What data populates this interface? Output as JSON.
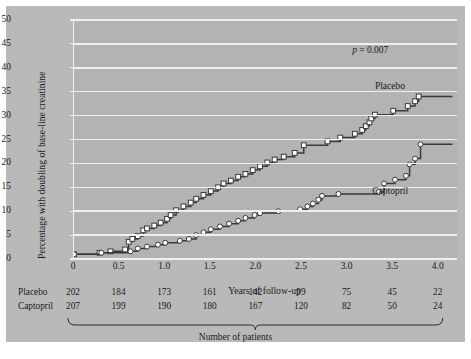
{
  "chart_data": {
    "type": "line",
    "subtype": "kaplan-meier-step",
    "title": "",
    "xlabel": "Years of follow-up",
    "ylabel": "Percentage with doubling of base-line creatinine",
    "xlim": [
      0,
      4.2
    ],
    "ylim": [
      0,
      50
    ],
    "xticks": [
      "0",
      "0.5",
      "1.0",
      "1.5",
      "2.0",
      "2.5",
      "3.0",
      "3.5",
      "4.0"
    ],
    "xtick_values": [
      0,
      0.5,
      1.0,
      1.5,
      2.0,
      2.5,
      3.0,
      3.5,
      4.0
    ],
    "yticks": [
      "0",
      "5",
      "10",
      "15",
      "20",
      "25",
      "30",
      "35",
      "40",
      "45",
      "50"
    ],
    "ytick_values": [
      0,
      5,
      10,
      15,
      20,
      25,
      30,
      35,
      40,
      45,
      50
    ],
    "grid": "horizontal",
    "legend_position": "inline-annotation",
    "annotations": [
      {
        "name": "p-value",
        "text": "p = 0.007",
        "x": 3.05,
        "y": 43.5
      }
    ],
    "series": [
      {
        "name": "Placebo",
        "marker": "open-square",
        "color": "#3a3a3a",
        "label_x": 3.3,
        "label_y": 36.0,
        "points": [
          [
            0.0,
            1.0
          ],
          [
            0.28,
            1.3
          ],
          [
            0.4,
            1.6
          ],
          [
            0.56,
            2.0
          ],
          [
            0.6,
            3.6
          ],
          [
            0.64,
            4.2
          ],
          [
            0.7,
            4.8
          ],
          [
            0.76,
            6.0
          ],
          [
            0.8,
            6.4
          ],
          [
            0.88,
            7.0
          ],
          [
            0.95,
            7.6
          ],
          [
            1.02,
            8.4
          ],
          [
            1.06,
            9.2
          ],
          [
            1.12,
            10.2
          ],
          [
            1.2,
            11.0
          ],
          [
            1.28,
            11.8
          ],
          [
            1.34,
            12.6
          ],
          [
            1.42,
            13.4
          ],
          [
            1.5,
            14.2
          ],
          [
            1.58,
            15.0
          ],
          [
            1.64,
            15.8
          ],
          [
            1.72,
            16.4
          ],
          [
            1.8,
            17.2
          ],
          [
            1.88,
            17.8
          ],
          [
            1.96,
            18.6
          ],
          [
            2.04,
            19.4
          ],
          [
            2.12,
            20.2
          ],
          [
            2.2,
            20.8
          ],
          [
            2.3,
            21.4
          ],
          [
            2.42,
            22.2
          ],
          [
            2.52,
            23.8
          ],
          [
            2.78,
            24.6
          ],
          [
            2.92,
            25.4
          ],
          [
            3.08,
            26.2
          ],
          [
            3.16,
            27.0
          ],
          [
            3.2,
            27.8
          ],
          [
            3.24,
            28.6
          ],
          [
            3.26,
            29.4
          ],
          [
            3.3,
            30.2
          ],
          [
            3.5,
            31.0
          ],
          [
            3.66,
            32.0
          ],
          [
            3.74,
            33.0
          ],
          [
            3.78,
            34.0
          ],
          [
            4.15,
            34.0
          ]
        ]
      },
      {
        "name": "Captopril",
        "marker": "open-circle",
        "color": "#3a3a3a",
        "label_x": 3.27,
        "label_y": 14.0,
        "points": [
          [
            0.0,
            1.0
          ],
          [
            0.3,
            1.3
          ],
          [
            0.62,
            1.6
          ],
          [
            0.7,
            2.2
          ],
          [
            0.8,
            2.6
          ],
          [
            0.92,
            3.0
          ],
          [
            1.0,
            3.4
          ],
          [
            1.16,
            3.8
          ],
          [
            1.26,
            4.2
          ],
          [
            1.34,
            5.0
          ],
          [
            1.42,
            5.6
          ],
          [
            1.5,
            6.2
          ],
          [
            1.6,
            6.8
          ],
          [
            1.7,
            7.4
          ],
          [
            1.8,
            8.0
          ],
          [
            1.88,
            8.6
          ],
          [
            1.98,
            9.2
          ],
          [
            2.04,
            9.6
          ],
          [
            2.24,
            10.0
          ],
          [
            2.48,
            10.4
          ],
          [
            2.56,
            11.0
          ],
          [
            2.62,
            11.6
          ],
          [
            2.68,
            12.4
          ],
          [
            2.72,
            13.2
          ],
          [
            2.9,
            13.6
          ],
          [
            3.34,
            14.0
          ],
          [
            3.4,
            15.8
          ],
          [
            3.52,
            16.6
          ],
          [
            3.64,
            17.4
          ],
          [
            3.68,
            19.8
          ],
          [
            3.74,
            21.0
          ],
          [
            3.8,
            24.0
          ],
          [
            4.15,
            24.0
          ]
        ]
      }
    ]
  },
  "table": {
    "caption": "Number of patients",
    "columns": [
      "0",
      "0.5",
      "1.0",
      "1.5",
      "2.0",
      "2.5",
      "3.0",
      "3.5",
      "4.0"
    ],
    "rows": [
      {
        "label": "Placebo",
        "values": [
          "202",
          "184",
          "173",
          "161",
          "142",
          "99",
          "75",
          "45",
          "22"
        ]
      },
      {
        "label": "Captopril",
        "values": [
          "207",
          "199",
          "190",
          "180",
          "167",
          "120",
          "82",
          "50",
          "24"
        ]
      }
    ]
  },
  "colors": {
    "figure_background": "#b9b9b9",
    "plot_background": "#b3b3b3",
    "gridline": "#f0f0f0",
    "curve": "#3a3a3a",
    "marker_fill": "#ffffff",
    "text": "#1a1a1a"
  }
}
